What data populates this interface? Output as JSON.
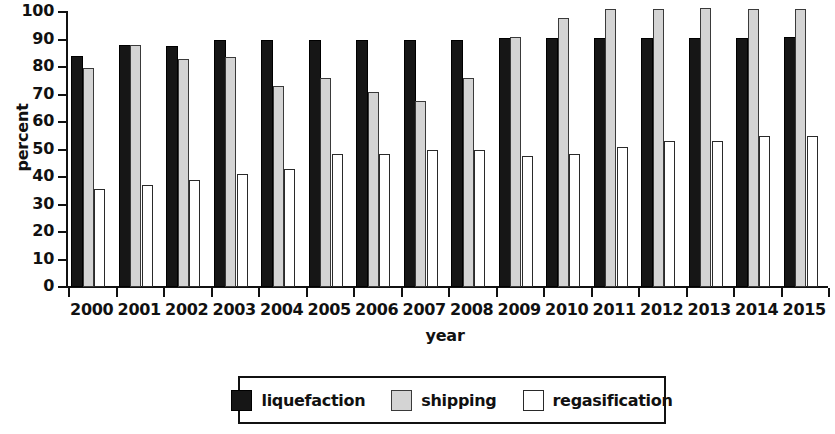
{
  "chart_data": {
    "type": "bar",
    "title": "",
    "xlabel": "year",
    "ylabel": "percent",
    "ylim": [
      0,
      100
    ],
    "yticks": [
      0,
      10,
      20,
      30,
      40,
      50,
      60,
      70,
      80,
      90,
      100
    ],
    "grid": false,
    "legend_position": "bottom",
    "categories": [
      "2000",
      "2001",
      "2002",
      "2003",
      "2004",
      "2005",
      "2006",
      "2007",
      "2008",
      "2009",
      "2010",
      "2011",
      "2012",
      "2013",
      "2014",
      "2015"
    ],
    "series": [
      {
        "name": "liquefaction",
        "color": "#161616",
        "values": [
          84,
          88,
          87.5,
          90,
          90,
          90,
          90,
          90,
          90,
          90.5,
          90.5,
          90.5,
          90.5,
          90.5,
          90.5,
          91
        ]
      },
      {
        "name": "shipping",
        "color": "#d4d4d4",
        "values": [
          79.5,
          88,
          83,
          83.5,
          73,
          76,
          71,
          67.5,
          76,
          91,
          98,
          101,
          101,
          101.5,
          101,
          101
        ]
      },
      {
        "name": "regasification",
        "color": "#ffffff",
        "values": [
          35.5,
          37,
          39,
          41,
          43,
          48.5,
          48.5,
          50,
          50,
          47.5,
          48.5,
          51,
          53,
          53,
          55,
          55
        ]
      }
    ]
  },
  "legend": {
    "items": [
      {
        "label": "liquefaction",
        "key": "liquefaction"
      },
      {
        "label": "shipping",
        "key": "shipping"
      },
      {
        "label": "regasification",
        "key": "regasification"
      }
    ]
  }
}
